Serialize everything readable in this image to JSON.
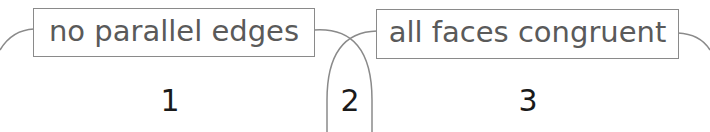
{
  "diagram": {
    "type": "venn",
    "sets": [
      {
        "label": "no parallel edges"
      },
      {
        "label": "all faces congruent"
      }
    ],
    "regions": [
      {
        "id": "1",
        "label": "1"
      },
      {
        "id": "2",
        "label": "2"
      },
      {
        "id": "3",
        "label": "3"
      }
    ],
    "colors": {
      "outline": "#8a8a8a",
      "label_text": "#5a5a5a",
      "number_text": "#1a1a1a"
    }
  }
}
